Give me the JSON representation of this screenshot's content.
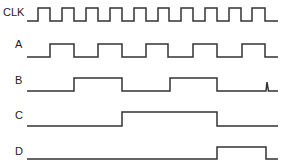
{
  "diagram": {
    "type": "timing-diagram",
    "signals": [
      {
        "name": "CLK",
        "label_x": 3,
        "label_y": 7,
        "high_y": 8,
        "low_y": 21,
        "x_start": 27,
        "x_end": 278,
        "edges": [
          38,
          50,
          62,
          74,
          86,
          98,
          110,
          122,
          134,
          146,
          158,
          169,
          181,
          193,
          205,
          217,
          229,
          241,
          252,
          265
        ],
        "initial": 0
      },
      {
        "name": "A",
        "label_x": 15,
        "label_y": 39,
        "high_y": 44,
        "low_y": 57,
        "x_start": 27,
        "x_end": 278,
        "edges": [
          50,
          74,
          98,
          122,
          146,
          168,
          193,
          217,
          242,
          265
        ],
        "initial": 0
      },
      {
        "name": "B",
        "label_x": 15,
        "label_y": 75,
        "high_y": 78,
        "low_y": 91,
        "x_start": 27,
        "x_end": 278,
        "edges": [
          74,
          122,
          170,
          217
        ],
        "initial": 0,
        "glitch_x": 267
      },
      {
        "name": "C",
        "label_x": 15,
        "label_y": 110,
        "high_y": 112,
        "low_y": 126,
        "x_start": 27,
        "x_end": 278,
        "edges": [
          122,
          217
        ],
        "initial": 0
      },
      {
        "name": "D",
        "label_x": 15,
        "label_y": 146,
        "high_y": 147,
        "low_y": 159,
        "x_start": 27,
        "x_end": 278,
        "edges": [
          217,
          266
        ],
        "initial": 0
      }
    ],
    "line_color": "#333333"
  }
}
